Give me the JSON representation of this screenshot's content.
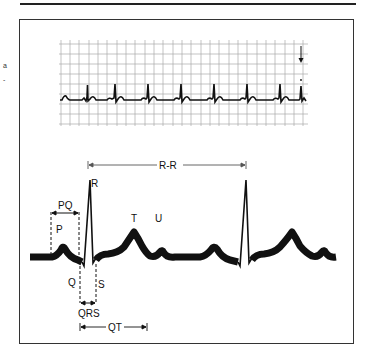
{
  "figure": {
    "side_marks": [
      "a",
      "-"
    ]
  },
  "strip": {
    "grid": {
      "x0": 59,
      "x1": 308,
      "y0": 44,
      "y1": 124,
      "h_spacing": 10,
      "v_spacing": 9.3
    },
    "beats_x": [
      75,
      114,
      153,
      192,
      232,
      271
    ],
    "marker": {
      "type": "arrow-down",
      "x": 301
    }
  },
  "waveform": {
    "labels": {
      "R": "R",
      "P": "P",
      "Q": "Q",
      "S": "S",
      "T": "T",
      "U": "U",
      "PQ": "PQ",
      "QRS": "QRS",
      "QT": "QT",
      "RR": "R-R"
    },
    "baseline_y": 256,
    "components": [
      "P wave",
      "PQ interval",
      "Q",
      "R",
      "S",
      "QRS complex",
      "T wave",
      "U wave",
      "QT interval",
      "R-R interval"
    ]
  }
}
